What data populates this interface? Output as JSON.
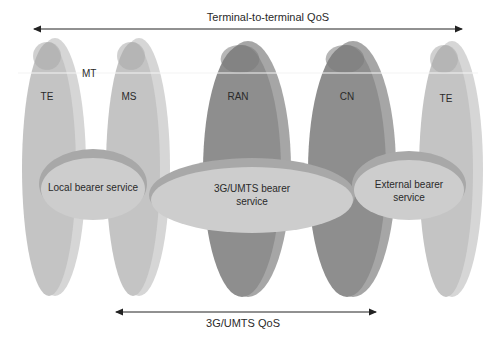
{
  "top_arrow": {
    "label": "Terminal-to-terminal QoS"
  },
  "bottom_arrow": {
    "label": "3G/UMTS QoS"
  },
  "mt_label": "MT",
  "nodes": [
    {
      "id": "te-left",
      "label": "TE",
      "tone": "light"
    },
    {
      "id": "ms",
      "label": "MS",
      "tone": "light"
    },
    {
      "id": "ran",
      "label": "RAN",
      "tone": "dark"
    },
    {
      "id": "cn",
      "label": "CN",
      "tone": "dark"
    },
    {
      "id": "te-right",
      "label": "TE",
      "tone": "light"
    }
  ],
  "bearers": [
    {
      "id": "local",
      "lines": [
        "Local bearer service"
      ]
    },
    {
      "id": "umts",
      "lines": [
        "3G/UMTS bearer",
        "service"
      ]
    },
    {
      "id": "external",
      "lines": [
        "External bearer",
        "service"
      ]
    }
  ],
  "colors": {
    "light_front": "#c4c4c4",
    "light_side": "#d6d6d6",
    "light_top": "#a9a9a9",
    "dark_front": "#8e8e8e",
    "dark_side": "#a6a6a6",
    "dark_top": "#7a7a7a",
    "bearer_fill": "#cdcdcd",
    "bearer_rim": "#a8a8a8",
    "arrow": "#222222"
  }
}
